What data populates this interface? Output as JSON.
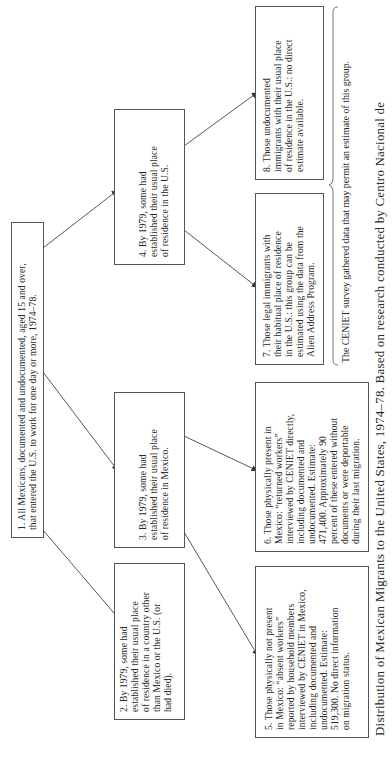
{
  "diagram": {
    "orientation": "rotated-90-ccw",
    "nodes": [
      {
        "id": 1,
        "text": "1. All Mexicans, documented and undocumented, aged 15 and over, that entered the U.S. to work for one day or more, 1974–78."
      },
      {
        "id": 2,
        "text": "2. By 1979, some had established their usual place of residence in a country other than Mexico or the U.S. (or had died)."
      },
      {
        "id": 3,
        "text": "3. By 1979, some had established their usual place of residence in Mexico."
      },
      {
        "id": 4,
        "text": "4. By 1979, some had established their usual place of residence in the U.S."
      },
      {
        "id": 5,
        "text": "5. Those physically not present in Mexico: “absent workers” reported by household members interviewed by CENIET in Mexico, including documented and undocumented. Estimate: 519,300. No direct information on migration status."
      },
      {
        "id": 6,
        "text": "6. Those physically present in Mexico: “returned workers” interviewed by CENIET directly, including documented and undocumented. Estimate: 471,400. Approximately 90 percent of these entered without documents or were deportable during their last migration."
      },
      {
        "id": 7,
        "text": "7. Those legal immigrants with their habitual place of residence in the U.S.: this group can be estimated using the data from the Alien Address Program."
      },
      {
        "id": 8,
        "text": "8. Those undocumented immigrants with their usual place of residence in the U.S.: no direct estimate available."
      }
    ],
    "edges": [
      {
        "from": 1,
        "to": 2
      },
      {
        "from": 1,
        "to": 3
      },
      {
        "from": 1,
        "to": 4
      },
      {
        "from": 3,
        "to": 5
      },
      {
        "from": 3,
        "to": 6
      },
      {
        "from": 4,
        "to": 7
      },
      {
        "from": 4,
        "to": 8
      }
    ],
    "box_lines": {
      "n1": [
        "1. All Mexicans, documented and undocumented, aged 15 and over,",
        "that entered the U.S. to work for one day or more, 1974–78."
      ],
      "n2": [
        "2. By 1979, some had",
        "established their usual place",
        "of residence in a country other",
        "than Mexico or the U.S. (or",
        "had died)."
      ],
      "n3": [
        "3. By 1979, some had",
        "established their usual place",
        "of residence in Mexico."
      ],
      "n4": [
        "4. By 1979, some had",
        "established their usual place",
        "of residence in the U.S."
      ],
      "n5": [
        "5. Those physically not present",
        "in Mexico: “absent workers”",
        "reported by household members",
        "interviewed by CENIET in Mexico,",
        "including documented and",
        "undocumented. Estimate:",
        "519,300. No direct information",
        "on migration status."
      ],
      "n6": [
        "6. Those physically present in",
        "Mexico: “returned workers”",
        "interviewed by CENIET directly,",
        "including documented and",
        "undocumented. Estimate:",
        "471,400. Approximately 90",
        "percent of these entered without",
        "documents or were deportable",
        "during their last migration."
      ],
      "n7": [
        "7. Those legal immigrants with",
        "their habitual place of residence",
        "in the U.S.: this group can be",
        "estimated using the data from the",
        "Alien Address Program."
      ],
      "n8": [
        "8. Those undocumented",
        "immigrants with their usual place",
        "of residence in the U.S.: no direct",
        "estimate available."
      ]
    },
    "brace_note": "The CENIET survey gathered data that may permit an estimate of this group.",
    "caption": "Distribution of Mexican Migrants to the United States, 1974–78. Based on research conducted by Centro Nacional de",
    "colors": {
      "line": "#444444",
      "border": "#555555",
      "text": "#2a2a2a",
      "background": "#ffffff"
    }
  }
}
